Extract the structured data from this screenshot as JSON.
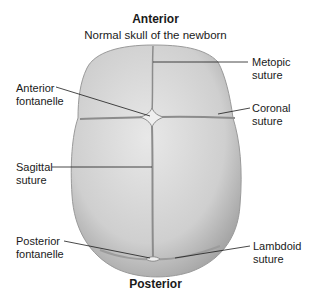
{
  "header": {
    "orientation_top": "Anterior",
    "title": "Normal skull of the newborn"
  },
  "footer": {
    "orientation_bottom": "Posterior"
  },
  "labels": {
    "left": [
      {
        "line1": "Anterior",
        "line2": "fontanelle"
      },
      {
        "line1": "Sagittal",
        "line2": "suture"
      },
      {
        "line1": "Posterior",
        "line2": "fontanelle"
      }
    ],
    "right": [
      {
        "line1": "Metopic",
        "line2": "suture"
      },
      {
        "line1": "Coronal",
        "line2": "suture"
      },
      {
        "line1": "Lambdoid",
        "line2": "suture"
      }
    ]
  },
  "colors": {
    "skull_fill": "#d9d9d9",
    "skull_shadow": "#a9a9a9",
    "suture": "#8c8c8c",
    "leader_line": "#1a1a1a"
  }
}
